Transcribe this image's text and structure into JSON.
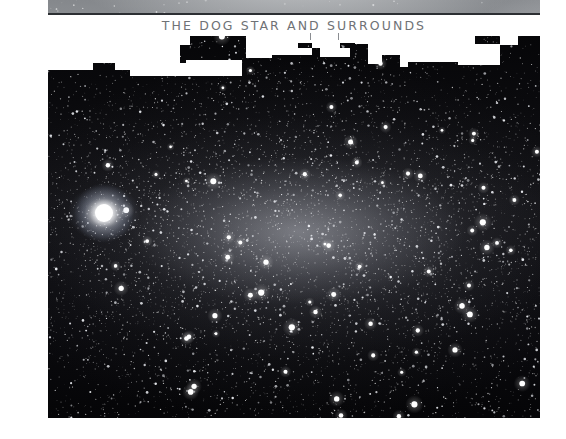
{
  "page": {
    "title": "THE DOG STAR AND SURROUNDS",
    "background_color": "#ffffff",
    "frame_background": "#040406",
    "title_color": "#6f7276",
    "rule_color": "#2c2f33",
    "mask_color": "#ffffff"
  },
  "photo": {
    "name": "starfield-photograph",
    "subject": "Sirius the Dog Star and surrounding Milky Way star field",
    "bright_star_label": "Sirius",
    "x": 48,
    "y": 13,
    "width": 492,
    "height": 405
  },
  "ticks": [
    {
      "x": 310,
      "y": 33
    },
    {
      "x": 338,
      "y": 33
    }
  ],
  "masks": [
    {
      "x": 48,
      "y": 15,
      "w": 492,
      "h": 21
    },
    {
      "x": 48,
      "y": 36,
      "w": 132,
      "h": 19
    },
    {
      "x": 48,
      "y": 55,
      "w": 45,
      "h": 15
    },
    {
      "x": 93,
      "y": 55,
      "w": 22,
      "h": 8
    },
    {
      "x": 115,
      "y": 36,
      "w": 65,
      "h": 34
    },
    {
      "x": 180,
      "y": 36,
      "w": 10,
      "h": 9
    },
    {
      "x": 246,
      "y": 36,
      "w": 52,
      "h": 12
    },
    {
      "x": 246,
      "y": 48,
      "w": 26,
      "h": 10
    },
    {
      "x": 272,
      "y": 48,
      "w": 40,
      "h": 7
    },
    {
      "x": 298,
      "y": 36,
      "w": 70,
      "h": 7
    },
    {
      "x": 312,
      "y": 43,
      "w": 28,
      "h": 5
    },
    {
      "x": 355,
      "y": 36,
      "w": 120,
      "h": 8
    },
    {
      "x": 368,
      "y": 44,
      "w": 14,
      "h": 20
    },
    {
      "x": 382,
      "y": 44,
      "w": 118,
      "h": 11
    },
    {
      "x": 400,
      "y": 55,
      "w": 8,
      "h": 12
    },
    {
      "x": 408,
      "y": 55,
      "w": 50,
      "h": 7
    },
    {
      "x": 458,
      "y": 55,
      "w": 42,
      "h": 10
    },
    {
      "x": 466,
      "y": 44,
      "w": 34,
      "h": 11
    },
    {
      "x": 500,
      "y": 36,
      "w": 18,
      "h": 9
    },
    {
      "x": 320,
      "y": 48,
      "w": 30,
      "h": 9
    },
    {
      "x": 186,
      "y": 60,
      "w": 56,
      "h": 16
    },
    {
      "x": 130,
      "y": 63,
      "w": 58,
      "h": 13
    },
    {
      "x": 11,
      "y": 140,
      "w": 28,
      "h": 24
    },
    {
      "x": 12,
      "y": 401,
      "w": 22,
      "h": 19
    },
    {
      "x": 0,
      "y": 0,
      "w": 48,
      "h": 439
    },
    {
      "x": 540,
      "y": 0,
      "w": 26,
      "h": 439
    },
    {
      "x": 0,
      "y": 418,
      "w": 566,
      "h": 21
    }
  ]
}
